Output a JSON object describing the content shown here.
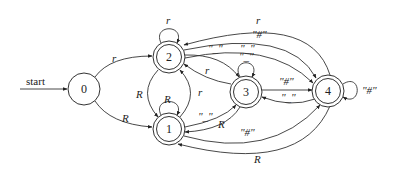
{
  "diagram": {
    "type": "finite-automaton",
    "start_label": "start",
    "nodes": [
      {
        "id": "0",
        "label": "0",
        "accepting": false
      },
      {
        "id": "1",
        "label": "1",
        "accepting": true
      },
      {
        "id": "2",
        "label": "2",
        "accepting": true
      },
      {
        "id": "3",
        "label": "3",
        "accepting": true
      },
      {
        "id": "4",
        "label": "4",
        "accepting": true
      }
    ],
    "edges": [
      {
        "from": "0",
        "to": "2",
        "label": "r"
      },
      {
        "from": "0",
        "to": "1",
        "label": "R"
      },
      {
        "from": "2",
        "to": "2",
        "label": "r"
      },
      {
        "from": "1",
        "to": "1",
        "label": "R"
      },
      {
        "from": "2",
        "to": "1",
        "label": "R"
      },
      {
        "from": "1",
        "to": "2",
        "label": "r"
      },
      {
        "from": "2",
        "to": "3",
        "label": "\"_\""
      },
      {
        "from": "3",
        "to": "2",
        "label": "r"
      },
      {
        "from": "3",
        "to": "3",
        "label": "\"_\""
      },
      {
        "from": "2",
        "to": "4",
        "label": "\"#\""
      },
      {
        "from": "4",
        "to": "2",
        "label": "r"
      },
      {
        "from": "1",
        "to": "3",
        "label": "\"_\""
      },
      {
        "from": "3",
        "to": "1",
        "label": "R"
      },
      {
        "from": "3",
        "to": "4",
        "label": "\"#\""
      },
      {
        "from": "4",
        "to": "3",
        "label": "\"_\""
      },
      {
        "from": "1",
        "to": "4",
        "label": "\"#\""
      },
      {
        "from": "4",
        "to": "1",
        "label": "R"
      },
      {
        "from": "4",
        "to": "4",
        "label": "\"#\""
      },
      {
        "from": "2",
        "to": "4",
        "label": "\"_\""
      }
    ]
  }
}
